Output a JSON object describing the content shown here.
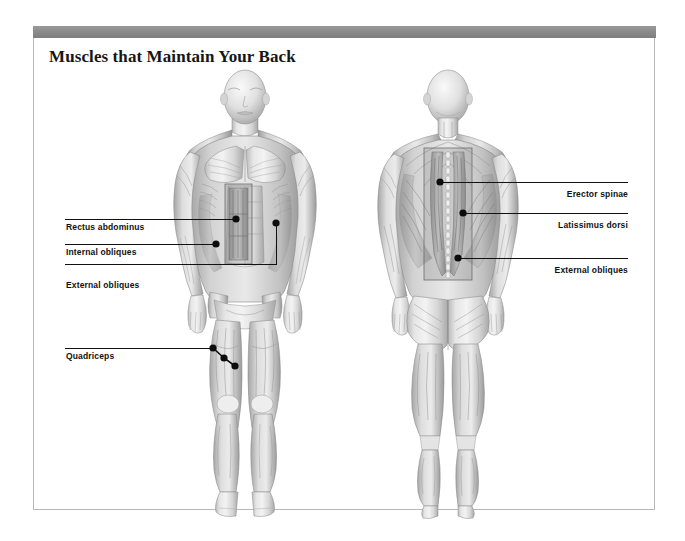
{
  "page": {
    "title": "Muscles that Maintain Your Back",
    "background_color": "#ffffff",
    "frame_border_color": "#b9b9b9",
    "header_bar_color": "#8b8b8b",
    "illustration_style": "grayscale anatomical rendering"
  },
  "figures": [
    {
      "id": "anterior-figure",
      "view": "anterior",
      "description": "Front view of male muscular anatomy with abdominal cutaway window"
    },
    {
      "id": "posterior-figure",
      "view": "posterior",
      "description": "Back view of male muscular anatomy with erector spinae cutaway window"
    }
  ],
  "callouts": {
    "left": [
      {
        "label": "Rectus abdominus",
        "side": "left"
      },
      {
        "label": "Internal obliques",
        "side": "left"
      },
      {
        "label": "External obliques",
        "side": "left"
      },
      {
        "label": "Quadriceps",
        "side": "left"
      }
    ],
    "right": [
      {
        "label": "Erector spinae",
        "side": "right"
      },
      {
        "label": "Latissimus dorsi",
        "side": "right"
      },
      {
        "label": "External obliques",
        "side": "right"
      }
    ]
  },
  "colors": {
    "leader_line": "#111111",
    "marker_dot": "#0d0d0d",
    "title_text": "#161616",
    "label_text": "#111111"
  }
}
